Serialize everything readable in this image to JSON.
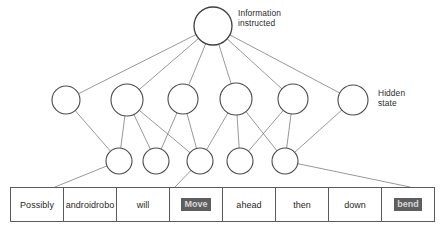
{
  "diagram": {
    "title_labels": {
      "information_instructed": "Information\ninstructed",
      "hidden_state": "Hidden\nstate"
    },
    "colors": {
      "node_stroke": "#4a4a4a",
      "edge_stroke": "#6b6b6b",
      "table_border": "#5a5a5a",
      "highlight_background": "#5e5e5e",
      "highlight_text": "#d8d8d8",
      "text": "#1f1f1f",
      "background": "#ffffff"
    },
    "layers": [
      {
        "name": "information-instructed-layer",
        "node_count": 1,
        "nodes": [
          {
            "cx": 213,
            "cy": 26,
            "r": 19
          }
        ]
      },
      {
        "name": "hidden-state-layer",
        "node_count": 6,
        "nodes": [
          {
            "cx": 66,
            "cy": 100,
            "r": 14
          },
          {
            "cx": 127,
            "cy": 100,
            "r": 16
          },
          {
            "cx": 183,
            "cy": 99,
            "r": 15
          },
          {
            "cx": 236,
            "cy": 99,
            "r": 16
          },
          {
            "cx": 293,
            "cy": 99,
            "r": 15
          },
          {
            "cx": 353,
            "cy": 100,
            "r": 15
          }
        ]
      },
      {
        "name": "intermediate-layer",
        "node_count": 5,
        "nodes": [
          {
            "cx": 119,
            "cy": 161,
            "r": 13
          },
          {
            "cx": 156,
            "cy": 161,
            "r": 13
          },
          {
            "cx": 200,
            "cy": 161,
            "r": 13
          },
          {
            "cx": 240,
            "cy": 161,
            "r": 13
          },
          {
            "cx": 285,
            "cy": 161,
            "r": 13
          }
        ]
      }
    ],
    "edges_top_to_hidden": [
      [
        213,
        26,
        66,
        100
      ],
      [
        213,
        26,
        127,
        100
      ],
      [
        213,
        26,
        183,
        99
      ],
      [
        213,
        26,
        236,
        99
      ],
      [
        213,
        26,
        293,
        99
      ],
      [
        213,
        26,
        353,
        100
      ]
    ],
    "edges_hidden_to_intermediate": [
      [
        66,
        100,
        119,
        161
      ],
      [
        127,
        100,
        119,
        161
      ],
      [
        127,
        100,
        156,
        161
      ],
      [
        127,
        100,
        200,
        161
      ],
      [
        183,
        99,
        200,
        161
      ],
      [
        183,
        99,
        156,
        161
      ],
      [
        236,
        99,
        200,
        161
      ],
      [
        236,
        99,
        240,
        161
      ],
      [
        293,
        99,
        240,
        161
      ],
      [
        293,
        99,
        285,
        161
      ],
      [
        353,
        100,
        285,
        161
      ],
      [
        236,
        99,
        285,
        161
      ]
    ],
    "edges_intermediate_to_table": [
      [
        119,
        161,
        55,
        187
      ],
      [
        200,
        161,
        175,
        187
      ],
      [
        285,
        161,
        410,
        187
      ]
    ]
  },
  "word_sequence": {
    "name": "input-word-sequence",
    "cells": [
      {
        "text": "Possibly",
        "highlighted": false
      },
      {
        "text": "androidrobo",
        "highlighted": false
      },
      {
        "text": "will",
        "highlighted": false
      },
      {
        "text": "Move",
        "highlighted": true
      },
      {
        "text": "ahead",
        "highlighted": false
      },
      {
        "text": "then",
        "highlighted": false
      },
      {
        "text": "down",
        "highlighted": false
      },
      {
        "text": "bend",
        "highlighted": true
      }
    ]
  }
}
